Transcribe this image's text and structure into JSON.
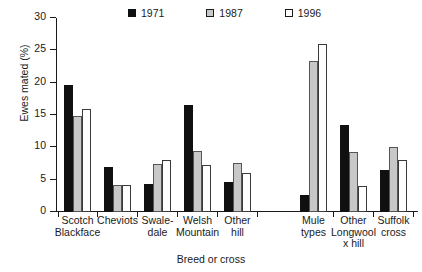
{
  "chart_data": {
    "type": "bar",
    "title": "",
    "xlabel": "Breed or cross",
    "ylabel": "Ewes mated (%)",
    "ylim": [
      0,
      30
    ],
    "yticks": [
      0,
      5,
      10,
      15,
      20,
      25,
      30
    ],
    "grid": false,
    "legend_position": "top-center",
    "categories": [
      "Scotch\nBlackface",
      "Cheviots",
      "Swale-\ndale",
      "Welsh\nMountain",
      "Other\nhill",
      "Mule\ntypes",
      "Other\nLongwool\nx hill",
      "Suffolk\ncross"
    ],
    "series": [
      {
        "name": "1971",
        "color": "#101010",
        "values": [
          19.7,
          7.0,
          4.4,
          16.6,
          4.6,
          2.6,
          13.5,
          6.5
        ]
      },
      {
        "name": "1987",
        "color": "#c8c8c8",
        "values": [
          14.9,
          4.2,
          7.5,
          9.4,
          7.6,
          23.4,
          9.3,
          10.0
        ]
      },
      {
        "name": "1996",
        "color": "#ffffff",
        "values": [
          16.0,
          4.2,
          8.1,
          7.2,
          6.0,
          26.0,
          4.1,
          8.0
        ]
      }
    ]
  },
  "legend": {
    "items": [
      {
        "label": "1971"
      },
      {
        "label": "1987"
      },
      {
        "label": "1996"
      }
    ]
  },
  "axis": {
    "y_title": "Ewes mated (%)",
    "x_title": "Breed or cross",
    "y_tick_labels": [
      "0",
      "5",
      "10",
      "15",
      "20",
      "25",
      "30"
    ]
  }
}
